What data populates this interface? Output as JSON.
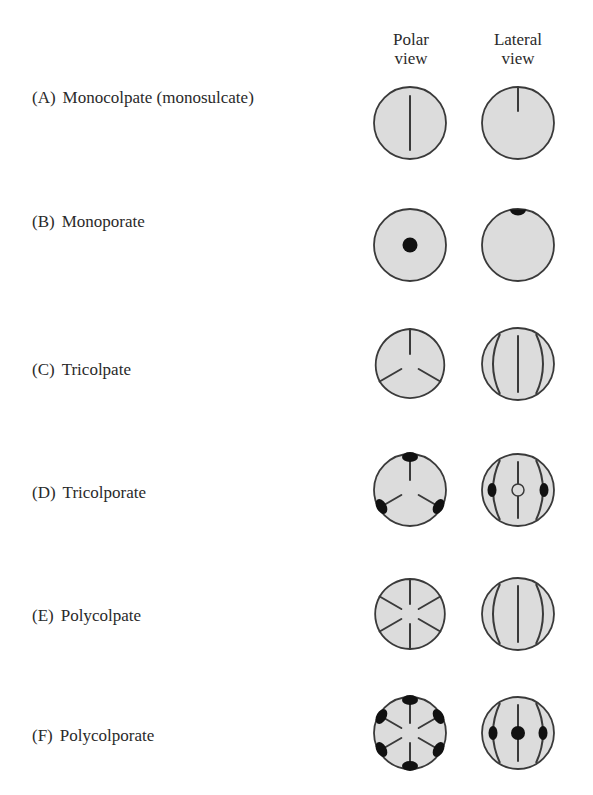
{
  "headers": {
    "polar": [
      "Polar",
      "view"
    ],
    "lateral": [
      "Lateral",
      "view"
    ]
  },
  "colors": {
    "grain_fill": "#dcdcdc",
    "outline": "#3a3a3a",
    "aperture": "#111111",
    "text": "#2a2a2a"
  },
  "rows": [
    {
      "letter": "(A)",
      "name": "Monocolpate (monosulcate)",
      "type": "monocolpate"
    },
    {
      "letter": "(B)",
      "name": "Monoporate",
      "type": "monoporate"
    },
    {
      "letter": "(C)",
      "name": "Tricolpate",
      "type": "tricolpate"
    },
    {
      "letter": "(D)",
      "name": "Tricolporate",
      "type": "tricolporate"
    },
    {
      "letter": "(E)",
      "name": "Polycolpate",
      "type": "polycolpate"
    },
    {
      "letter": "(F)",
      "name": "Polycolporate",
      "type": "polycolporate"
    }
  ]
}
